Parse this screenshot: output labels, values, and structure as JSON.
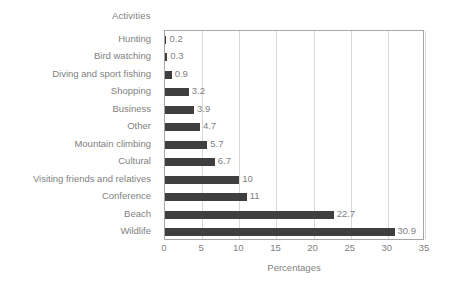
{
  "chart_data": {
    "type": "bar",
    "orientation": "horizontal",
    "title": "Activities",
    "xlabel": "Percentages",
    "ylabel": "",
    "xlim": [
      0,
      35
    ],
    "xticks": [
      0,
      5,
      10,
      15,
      20,
      25,
      30,
      35
    ],
    "xtick_labels": [
      "0",
      "5",
      "10",
      "15",
      "20",
      "25",
      "30",
      "35"
    ],
    "grid": "vertical",
    "legend": "none",
    "bar_color": "#3f3f3f",
    "text_color": "#7f7f7f",
    "categories": [
      "Hunting",
      "Bird watching",
      "Diving and sport fishing",
      "Shopping",
      "Business",
      "Other",
      "Mountain climbing",
      "Cultural",
      "Visiting friends and relatives",
      "Conference",
      "Beach",
      "Wildlife"
    ],
    "values": [
      0.2,
      0.3,
      0.9,
      3.2,
      3.9,
      4.7,
      5.7,
      6.7,
      10,
      11,
      22.7,
      30.9
    ],
    "data_labels": [
      "0.2",
      "0.3",
      "0.9",
      "3.2",
      "3.9",
      "4.7",
      "5.7",
      "6.7",
      "10",
      "11",
      "22.7",
      "30.9"
    ]
  }
}
